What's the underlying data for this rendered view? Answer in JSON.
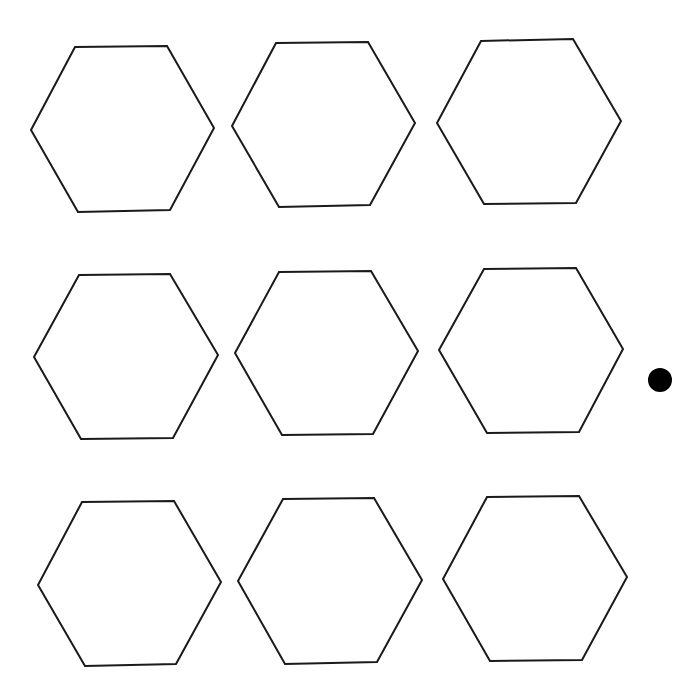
{
  "diagram": {
    "background": "#ffffff",
    "stroke_color": "#1a1a1a",
    "grid": {
      "rows": 3,
      "cols": 3
    },
    "hexagons": [
      {
        "row": 1,
        "col": 1,
        "points": "75,47 167,46 214,128 170,210 78,212 31,130"
      },
      {
        "row": 1,
        "col": 2,
        "points": "276,43 368,42 415,123 370,205 279,207 232,126"
      },
      {
        "row": 1,
        "col": 3,
        "points": "481,41 573,39 621,121 576,203 484,204 437,123"
      },
      {
        "row": 2,
        "col": 1,
        "points": "79,275 170,274 218,355 173,438 81,439 34,357"
      },
      {
        "row": 2,
        "col": 2,
        "points": "279,272 371,271 418,351 373,434 282,435 235,353"
      },
      {
        "row": 2,
        "col": 3,
        "points": "484,269 576,268 623,349 579,432 487,433 439,350"
      },
      {
        "row": 3,
        "col": 1,
        "points": "82,502 174,501 221,582 176,664 85,666 38,585"
      },
      {
        "row": 3,
        "col": 2,
        "points": "283,499 374,498 422,580 377,662 285,664 238,581"
      },
      {
        "row": 3,
        "col": 3,
        "points": "487,497 579,496 627,577 582,660 490,661 443,579"
      }
    ],
    "marker_dot": {
      "cx": 660,
      "cy": 380,
      "r": 12,
      "color": "#000000",
      "position": "right of row 2"
    }
  }
}
